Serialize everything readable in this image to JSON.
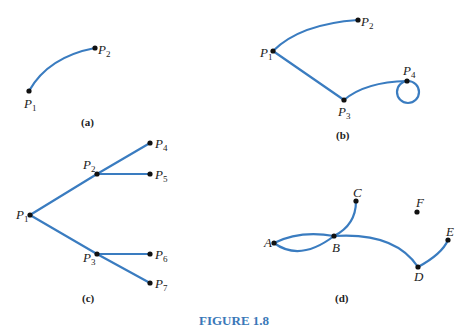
{
  "figure": {
    "caption": "FIGURE 1.8",
    "edge_color": "#3a7cc0",
    "caption_color": "#3a78b8"
  },
  "panels": {
    "a": {
      "label": "(a)",
      "nodes": [
        {
          "name": "P",
          "sub": "1"
        },
        {
          "name": "P",
          "sub": "2"
        }
      ],
      "edges": [
        [
          "P1",
          "P2"
        ]
      ]
    },
    "b": {
      "label": "(b)",
      "nodes": [
        {
          "name": "P",
          "sub": "1"
        },
        {
          "name": "P",
          "sub": "2"
        },
        {
          "name": "P",
          "sub": "3"
        },
        {
          "name": "P",
          "sub": "4"
        }
      ],
      "edges": [
        [
          "P1",
          "P2"
        ],
        [
          "P1",
          "P3"
        ],
        [
          "P3",
          "P4"
        ],
        [
          "P4",
          "P4"
        ]
      ]
    },
    "c": {
      "label": "(c)",
      "nodes": [
        {
          "name": "P",
          "sub": "1"
        },
        {
          "name": "P",
          "sub": "2"
        },
        {
          "name": "P",
          "sub": "3"
        },
        {
          "name": "P",
          "sub": "4"
        },
        {
          "name": "P",
          "sub": "5"
        },
        {
          "name": "P",
          "sub": "6"
        },
        {
          "name": "P",
          "sub": "7"
        }
      ],
      "edges": [
        [
          "P1",
          "P2"
        ],
        [
          "P1",
          "P3"
        ],
        [
          "P2",
          "P4"
        ],
        [
          "P2",
          "P5"
        ],
        [
          "P3",
          "P6"
        ],
        [
          "P3",
          "P7"
        ]
      ]
    },
    "d": {
      "label": "(d)",
      "nodes": [
        {
          "name": "A"
        },
        {
          "name": "B"
        },
        {
          "name": "C"
        },
        {
          "name": "D"
        },
        {
          "name": "E"
        },
        {
          "name": "F"
        }
      ],
      "edges": [
        [
          "A",
          "B"
        ],
        [
          "A",
          "B"
        ],
        [
          "B",
          "C"
        ],
        [
          "B",
          "D"
        ],
        [
          "D",
          "E"
        ]
      ]
    }
  }
}
